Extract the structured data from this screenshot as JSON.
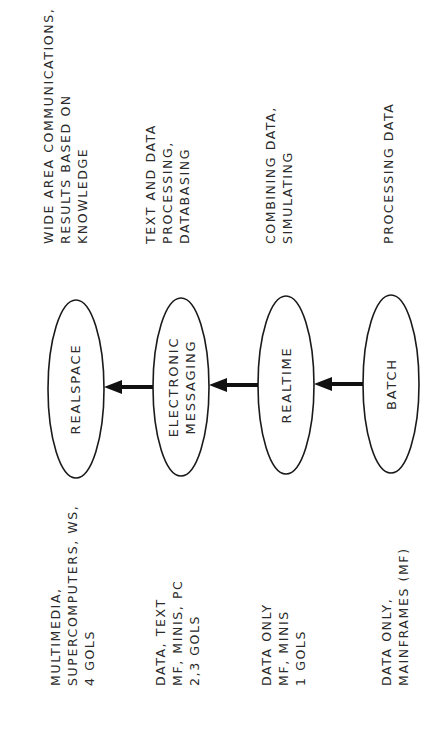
{
  "diagram": {
    "orientation": "rotated-90-ccw",
    "nodes": [
      {
        "id": "realspace",
        "label_lines": [
          "REALSPACE"
        ]
      },
      {
        "id": "electronic-messaging",
        "label_lines": [
          "ELECTRONIC",
          "MESSAGING"
        ]
      },
      {
        "id": "realtime",
        "label_lines": [
          "REALTIME"
        ]
      },
      {
        "id": "batch",
        "label_lines": [
          "BATCH"
        ]
      }
    ],
    "edges": [
      {
        "from": "batch",
        "to": "realtime"
      },
      {
        "from": "realtime",
        "to": "electronic-messaging"
      },
      {
        "from": "electronic-messaging",
        "to": "realspace"
      }
    ],
    "capabilities": [
      {
        "node": "realspace",
        "lines": [
          "WIDE AREA COMMUNICATIONS,",
          "RESULTS BASED ON",
          "KNOWLEDGE"
        ]
      },
      {
        "node": "electronic-messaging",
        "lines": [
          "TEXT AND DATA",
          "PROCESSING,",
          "DATABASING"
        ]
      },
      {
        "node": "realtime",
        "lines": [
          "COMBINING DATA,",
          "SIMULATING"
        ]
      },
      {
        "node": "batch",
        "lines": [
          "PROCESSING DATA"
        ]
      }
    ],
    "platforms": [
      {
        "node": "realspace",
        "lines": [
          "MULTIMEDIA,",
          "SUPERCOMPUTERS, WS,",
          "4 GOLS"
        ]
      },
      {
        "node": "electronic-messaging",
        "lines": [
          "DATA, TEXT",
          "MF, MINIS, PC",
          "2,3 GOLS"
        ]
      },
      {
        "node": "realtime",
        "lines": [
          "DATA ONLY",
          "MF, MINIS",
          "1 GOLS"
        ]
      },
      {
        "node": "batch",
        "lines": [
          "DATA ONLY,",
          "MAINFRAMES (MF)"
        ]
      }
    ],
    "colors": {
      "stroke": "#1a1a1a",
      "text": "#2a2a2a",
      "background": "#ffffff"
    }
  }
}
